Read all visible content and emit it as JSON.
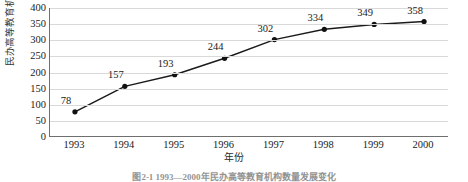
{
  "chart_data": {
    "type": "line",
    "title": "",
    "caption": "图2-1  1993—2000年民办高等教育机构数量发展变化",
    "xlabel": "年份",
    "ylabel": "民办高等教育机构数量/所",
    "categories": [
      "1993",
      "1994",
      "1995",
      "1996",
      "1997",
      "1998",
      "1999",
      "2000"
    ],
    "values": [
      78,
      157,
      193,
      244,
      302,
      334,
      349,
      358
    ],
    "data_labels": [
      "78",
      "157",
      "193",
      "244",
      "302",
      "334",
      "349",
      "358"
    ],
    "ylim": [
      0,
      400
    ],
    "ytick_step": 50,
    "yticks": [
      "400",
      "350",
      "300",
      "250",
      "200",
      "150",
      "100",
      "50",
      "0"
    ],
    "grid": "horizontal",
    "legend": "none",
    "series": [
      {
        "name": "民办高等教育机构数量",
        "values": [
          78,
          157,
          193,
          244,
          302,
          334,
          349,
          358
        ]
      }
    ],
    "colors": {
      "line": "#1b1b1b",
      "marker": "#111111",
      "grid": "#d9d9d9",
      "axis": "#6f6f6f",
      "background": "#ffffff"
    }
  }
}
